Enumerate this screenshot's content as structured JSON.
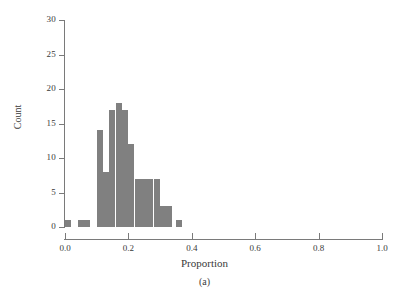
{
  "figure": {
    "caption": "(a)",
    "bar_color": "#808080",
    "axis_color": "#7a7a7a",
    "text_color": "#3a3a3a"
  },
  "axes": {
    "x_title": "Proportion",
    "y_title": "Count",
    "x_ticks": [
      "0.0",
      "0.2",
      "0.4",
      "0.6",
      "0.8",
      "1.0"
    ],
    "x_tick_values": [
      0.0,
      0.2,
      0.4,
      0.6,
      0.8,
      1.0
    ],
    "y_ticks": [
      "0",
      "5",
      "10",
      "15",
      "20",
      "25",
      "30"
    ],
    "y_tick_values": [
      0,
      5,
      10,
      15,
      20,
      25,
      30
    ]
  },
  "chart_data": {
    "type": "bar",
    "title": "",
    "subtitle": "",
    "xlabel": "Proportion",
    "ylabel": "Count",
    "xlim": [
      0.0,
      1.0
    ],
    "ylim": [
      0,
      30
    ],
    "grid": false,
    "legend": null,
    "annotations": [
      "(a)"
    ],
    "bin_width": 0.02,
    "categories": [
      "0.01",
      "0.05",
      "0.07",
      "0.11",
      "0.13",
      "0.15",
      "0.17",
      "0.19",
      "0.21",
      "0.23",
      "0.25",
      "0.27",
      "0.29",
      "0.31",
      "0.33",
      "0.36"
    ],
    "x": [
      0.01,
      0.05,
      0.07,
      0.11,
      0.13,
      0.15,
      0.17,
      0.19,
      0.21,
      0.23,
      0.25,
      0.27,
      0.29,
      0.31,
      0.33,
      0.36
    ],
    "values": [
      1,
      1,
      1,
      14,
      8,
      17,
      18,
      17,
      12,
      7,
      7,
      7,
      7,
      3,
      3,
      1
    ]
  }
}
